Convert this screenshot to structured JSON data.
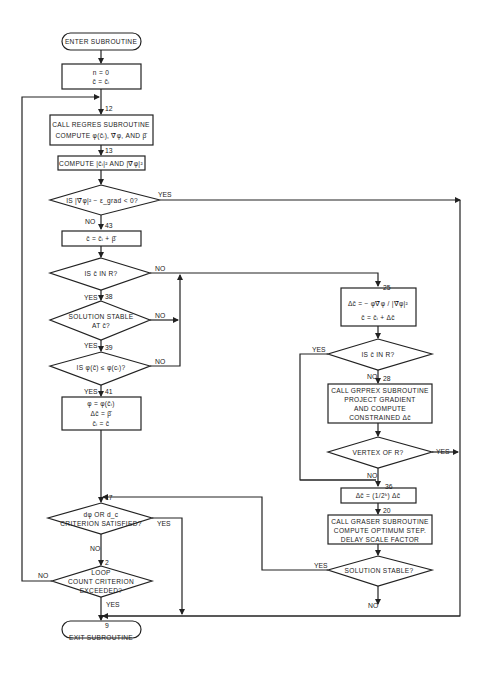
{
  "flowchart": {
    "start": "ENTER SUBROUTINE",
    "end": "EXIT SUBROUTINE",
    "init": {
      "line1": "n = 0",
      "line2": "c̄ = c̄ᵢ"
    },
    "regres": {
      "step": "12",
      "line1": "CALL REGRES SUBROUTINE",
      "line2": "COMPUTE φ(c̄ᵢ), ∇̄φ, AND β̄"
    },
    "norms": {
      "step": "13",
      "text": "COMPUTE |c̄ᵢ|² AND |∇̄φ|²"
    },
    "grad_check": {
      "text": "IS |∇̄φ|² − ε_grad < 0?",
      "yes": "YES",
      "no": "NO"
    },
    "update_c": {
      "step": "43",
      "text": "c̄ = c̄ᵢ + β̄"
    },
    "in_r_left": {
      "text": "IS c̄ IN R?",
      "yes": "YES",
      "no": "NO"
    },
    "stable_at_c": {
      "step": "38",
      "line1": "SOLUTION STABLE",
      "line2": "AT c̄?",
      "yes": "YES",
      "no": "NO"
    },
    "phi_check": {
      "step": "39",
      "text": "IS φ(c̄) ≤ φ(cᵢ)?",
      "yes": "YES",
      "no": "NO"
    },
    "accept": {
      "step": "41",
      "line1": "φ = φ(c̄ᵢ)",
      "line2": "Δc̄ = β̄",
      "line3": "c̄ᵢ = c̄"
    },
    "gradient_step": {
      "step": "25",
      "line1": "Δc̄ = − φ∇̄φ / |∇̄φ|²",
      "line2": "c̄ = c̄ᵢ + Δc̄"
    },
    "in_r_right": {
      "text": "IS c̄ IN R?",
      "yes": "YES",
      "no": "NO"
    },
    "grprex": {
      "step": "28",
      "line1": "CALL GRPREX SUBROUTINE",
      "line2": "PROJECT GRADIENT",
      "line3": "AND COMPUTE",
      "line4": "CONSTRAINED Δc̄"
    },
    "vertex": {
      "text": "VERTEX OF R?",
      "yes": "YES",
      "no": "NO"
    },
    "halve": {
      "step": "36",
      "text": "Δc̄ = (1/2ᵏ) Δc̄"
    },
    "graser": {
      "step": "20",
      "line1": "CALL GRASER SUBROUTINE",
      "line2": "COMPUTE OPTIMUM STEP.",
      "line3": "DELAY SCALE FACTOR"
    },
    "stable_right": {
      "text": "SOLUTION STABLE?",
      "yes": "YES",
      "no": "NO"
    },
    "criterion": {
      "step": "17",
      "line1": "dφ OR d_c",
      "line2": "CRITERION SATISFIED?",
      "yes": "YES",
      "no": "NO"
    },
    "loop": {
      "step": "2",
      "line1": "LOOP",
      "line2": "COUNT CRITERION",
      "line3": "EXCEEDED?",
      "yes": "YES",
      "no": "NO"
    },
    "exit_step": "9"
  }
}
